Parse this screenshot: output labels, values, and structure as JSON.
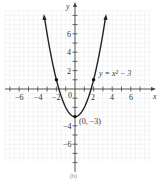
{
  "chart_data": {
    "type": "line",
    "title": "",
    "xlabel": "x",
    "ylabel": "y",
    "xlim": [
      -7.5,
      7.5
    ],
    "ylim": [
      -7.5,
      8.5
    ],
    "grid": true,
    "x_ticks": [
      -6,
      -4,
      -2,
      2,
      4,
      6
    ],
    "y_ticks": [
      -6,
      -4,
      2,
      4,
      6
    ],
    "origin_label": "0",
    "series": [
      {
        "name": "y = x^2 - 3",
        "equation": "y = x² − 3",
        "x": [
          -3.3,
          -3,
          -2.5,
          -2,
          -1.5,
          -1,
          -0.5,
          0,
          0.5,
          1,
          1.5,
          2,
          2.5,
          3,
          3.3
        ],
        "values": [
          7.89,
          6,
          3.25,
          1,
          -0.75,
          -2,
          -2.75,
          -3,
          -2.75,
          -2,
          -0.75,
          1,
          3.25,
          6,
          7.89
        ]
      }
    ],
    "points": [
      {
        "x": -2,
        "y": 1
      },
      {
        "x": 2,
        "y": 1
      },
      {
        "x": 0,
        "y": -3,
        "label": "(0, −3)"
      }
    ],
    "annotations": [
      {
        "text": "y = x² − 3",
        "x": 2.7,
        "y": 2
      },
      {
        "text": "(0, −3)",
        "x": 0.3,
        "y": -3.3
      }
    ],
    "caption": "(b)"
  },
  "labels": {
    "x_axis": "x",
    "y_axis": "y",
    "equation": "y = x² − 3",
    "vertex": "(0, −3)",
    "origin": "0",
    "caption": "(b)",
    "xt": [
      "−6",
      "−4",
      "−2",
      "2",
      "4",
      "6"
    ],
    "yt": [
      "6",
      "4",
      "2",
      "−4",
      "−6"
    ]
  }
}
